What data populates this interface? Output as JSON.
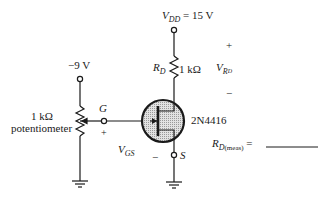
{
  "supply": {
    "symbol_main": "V",
    "symbol_sub": "DD",
    "equals": "= 15 V"
  },
  "gate_supply": {
    "label": "−9 V"
  },
  "potentiometer": {
    "value": "1 kΩ",
    "name": "potentiometer"
  },
  "gate": {
    "label": "G",
    "plus": "+"
  },
  "vgs": {
    "main": "V",
    "sub": "GS",
    "minus": "−"
  },
  "source": {
    "label": "S"
  },
  "drain_resistor": {
    "symbol_main": "R",
    "symbol_sub": "D",
    "value": "1 kΩ"
  },
  "vrd": {
    "main": "V",
    "sub": "R",
    "subsub": "D",
    "plus": "+",
    "minus": "−"
  },
  "transistor": {
    "part": "2N4416"
  },
  "measurement": {
    "main": "R",
    "sub": "D",
    "sub2": "(meas)",
    "equals": "=",
    "blank": ""
  },
  "colors": {
    "line": "#1a1a1a",
    "body_fill": "#cfcfcf",
    "background": "#ffffff"
  }
}
